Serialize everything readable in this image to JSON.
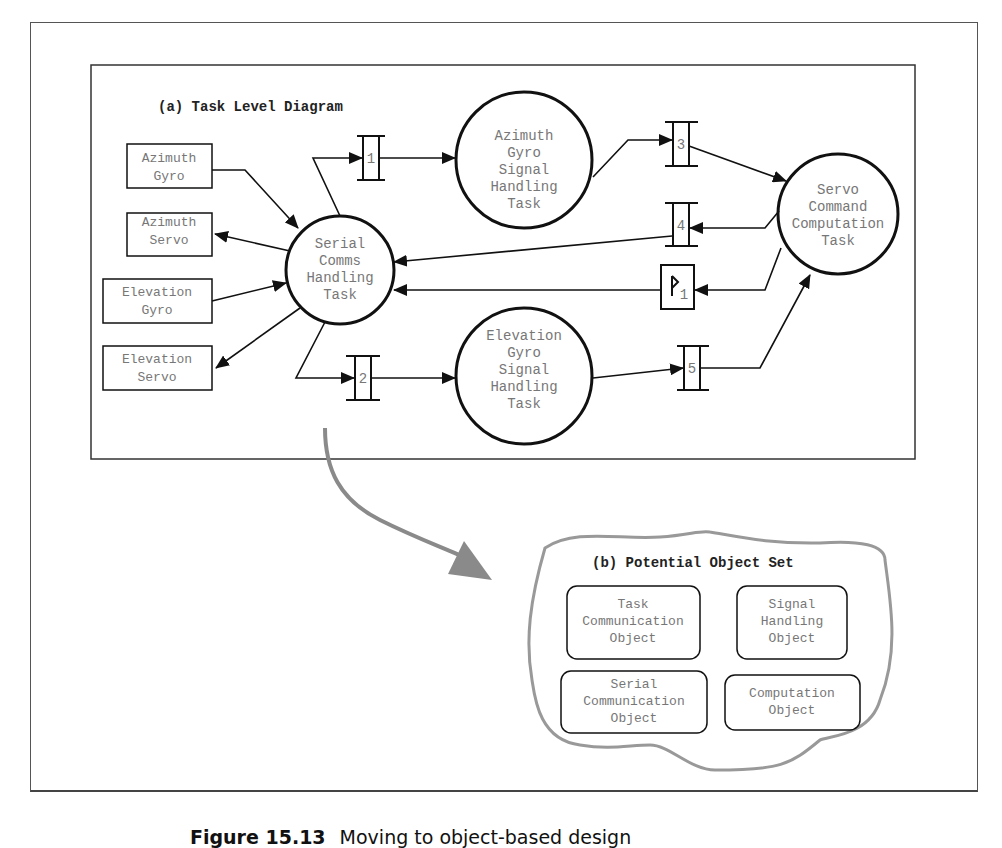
{
  "panel_a": {
    "title": "(a) Task Level Diagram",
    "external_boxes": [
      {
        "id": "azimuth-gyro",
        "lines": [
          "Azimuth",
          "Gyro"
        ]
      },
      {
        "id": "azimuth-servo",
        "lines": [
          "Azimuth",
          "Servo"
        ]
      },
      {
        "id": "elevation-gyro",
        "lines": [
          "Elevation",
          "Gyro"
        ]
      },
      {
        "id": "elevation-servo",
        "lines": [
          "Elevation",
          "Servo"
        ]
      }
    ],
    "tasks": [
      {
        "id": "serial-comms",
        "lines": [
          "Serial",
          "Comms",
          "Handling",
          "Task"
        ]
      },
      {
        "id": "azimuth-gyro-signal",
        "lines": [
          "Azimuth",
          "Gyro",
          "Signal",
          "Handling",
          "Task"
        ]
      },
      {
        "id": "elevation-gyro-signal",
        "lines": [
          "Elevation",
          "Gyro",
          "Signal",
          "Handling",
          "Task"
        ]
      },
      {
        "id": "servo-command",
        "lines": [
          "Servo",
          "Command",
          "Computation",
          "Task"
        ]
      }
    ],
    "channels": [
      "1",
      "2",
      "3",
      "4",
      "5"
    ],
    "flag": {
      "label": "1"
    }
  },
  "panel_b": {
    "title": "(b) Potential Object Set",
    "objects": [
      {
        "id": "task-communication",
        "lines": [
          "Task",
          "Communication",
          "Object"
        ]
      },
      {
        "id": "signal-handling",
        "lines": [
          "Signal",
          "Handling",
          "Object"
        ]
      },
      {
        "id": "serial-communication",
        "lines": [
          "Serial",
          "Communication",
          "Object"
        ]
      },
      {
        "id": "computation",
        "lines": [
          "Computation",
          "Object"
        ]
      }
    ]
  },
  "caption": {
    "figure": "Figure 15.13",
    "text": "Moving to object-based design"
  },
  "colors": {
    "line": "#111111",
    "text": "#777777",
    "transition_arrow": "#8a8a8a"
  }
}
